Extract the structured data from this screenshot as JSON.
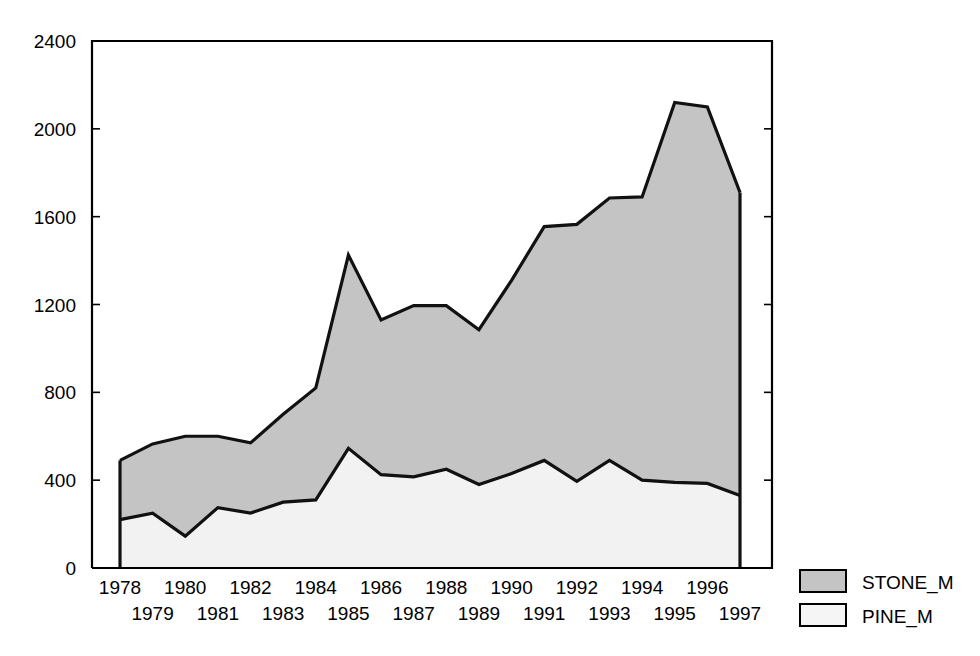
{
  "chart_data": {
    "type": "area",
    "title": "",
    "subtitle": "",
    "xlabel": "",
    "ylabel": "",
    "stacked": true,
    "grid": false,
    "legend_position": "right",
    "xlim": [
      1978,
      1997
    ],
    "ylim": [
      0,
      2400
    ],
    "yticks": [
      0,
      400,
      800,
      1200,
      1600,
      2000,
      2400
    ],
    "ytick_labels": [
      "0",
      "400",
      "800",
      "1200",
      "1600",
      "2000",
      "2400"
    ],
    "categories": [
      1978,
      1979,
      1980,
      1981,
      1982,
      1983,
      1984,
      1985,
      1986,
      1987,
      1988,
      1989,
      1990,
      1991,
      1992,
      1993,
      1994,
      1995,
      1996,
      1997
    ],
    "xtick_labels": [
      "1978",
      "1979",
      "1980",
      "1981",
      "1982",
      "1983",
      "1984",
      "1985",
      "1986",
      "1987",
      "1988",
      "1989",
      "1990",
      "1991",
      "1992",
      "1993",
      "1994",
      "1995",
      "1996",
      "1997"
    ],
    "xtick_rows": [
      [
        "1978",
        "1980",
        "1982",
        "1984",
        "1986",
        "1988",
        "1990",
        "1992",
        "1994",
        "1996"
      ],
      [
        "1979",
        "1981",
        "1983",
        "1985",
        "1987",
        "1989",
        "1991",
        "1993",
        "1995",
        "1997"
      ]
    ],
    "series": [
      {
        "name": "PINE_M",
        "color": "#f2f2f2",
        "values": [
          220,
          250,
          145,
          275,
          250,
          300,
          310,
          545,
          425,
          415,
          450,
          380,
          430,
          490,
          395,
          490,
          400,
          390,
          385,
          330
        ]
      },
      {
        "name": "STONE_M",
        "color": "#c4c4c4",
        "values": [
          270,
          315,
          455,
          325,
          320,
          400,
          510,
          880,
          705,
          780,
          745,
          705,
          880,
          1065,
          1170,
          1195,
          1290,
          1730,
          1715,
          1380
        ]
      }
    ],
    "cumulative_totals": [
      490,
      565,
      600,
      600,
      570,
      700,
      820,
      1425,
      1130,
      1195,
      1195,
      1085,
      1310,
      1555,
      1565,
      1685,
      1690,
      2120,
      2100,
      1710
    ]
  },
  "legend": {
    "items": [
      {
        "label": "STONE_M",
        "swatch_color": "#c4c4c4"
      },
      {
        "label": "PINE_M",
        "swatch_color": "#f5f5f5"
      }
    ]
  }
}
